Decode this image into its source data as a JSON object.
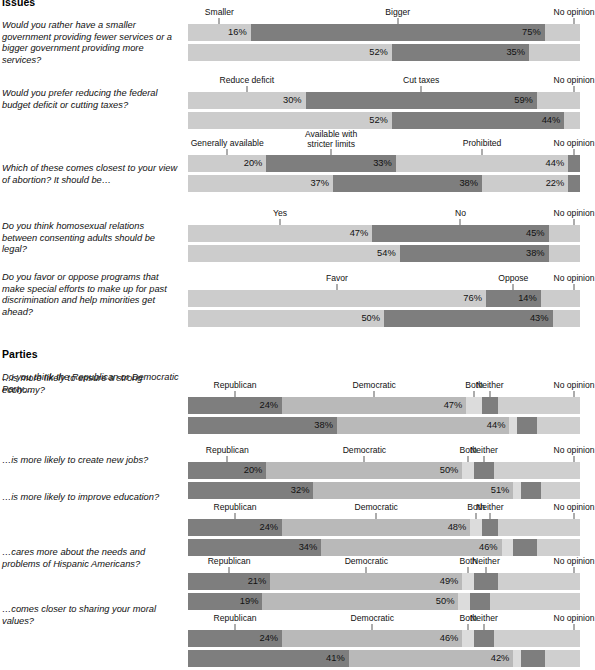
{
  "sections": [
    {
      "id": "issues",
      "title": "Issues"
    },
    {
      "id": "parties",
      "title": "Parties"
    }
  ],
  "row_labels": {
    "hispanics": "Hispanics",
    "non_hispanics": "Non-Hispanics"
  },
  "chart_data": [
    {
      "type": "bar",
      "section": "Issues",
      "title": "Would you rather have a smaller government providing fewer services or a bigger government providing more services?",
      "categories": [
        "Smaller",
        "Bigger",
        "No opinion"
      ],
      "series": [
        {
          "name": "Hispanics",
          "values": [
            16,
            75,
            9
          ],
          "labels": [
            "16%",
            "75%",
            ""
          ]
        },
        {
          "name": "Non-Hispanics",
          "values": [
            52,
            35,
            13
          ],
          "labels": [
            "52%",
            "35%",
            ""
          ]
        }
      ],
      "xlabel": "",
      "ylabel": "",
      "xlim": [
        0,
        100
      ],
      "grid": false,
      "legend": "none"
    },
    {
      "type": "bar",
      "section": "Issues",
      "title": "Would you prefer reducing the federal budget deficit or cutting taxes?",
      "categories": [
        "Reduce deficit",
        "Cut taxes",
        "No opinion"
      ],
      "series": [
        {
          "name": "Hispanics",
          "values": [
            30,
            59,
            11
          ],
          "labels": [
            "30%",
            "59%",
            ""
          ]
        },
        {
          "name": "Non-Hispanics",
          "values": [
            52,
            44,
            4
          ],
          "labels": [
            "52%",
            "44%",
            ""
          ]
        }
      ],
      "xlabel": "",
      "ylabel": "",
      "xlim": [
        0,
        100
      ],
      "grid": false,
      "legend": "none"
    },
    {
      "type": "bar",
      "section": "Issues",
      "title": "Which of these comes closest to your view of abortion? It should be…",
      "categories": [
        "Generally available",
        "Available with stricter limits",
        "Prohibited",
        "No opinion"
      ],
      "series": [
        {
          "name": "Hispanics",
          "values": [
            20,
            33,
            44,
            3
          ],
          "labels": [
            "20%",
            "33%",
            "44%",
            ""
          ]
        },
        {
          "name": "Non-Hispanics",
          "values": [
            37,
            38,
            22,
            3
          ],
          "labels": [
            "37%",
            "38%",
            "22%",
            ""
          ]
        }
      ],
      "xlabel": "",
      "ylabel": "",
      "xlim": [
        0,
        100
      ],
      "grid": false,
      "legend": "none"
    },
    {
      "type": "bar",
      "section": "Issues",
      "title": "Do you think homosexual relations between consenting adults should be legal?",
      "categories": [
        "Yes",
        "No",
        "No opinion"
      ],
      "series": [
        {
          "name": "Hispanics",
          "values": [
            47,
            45,
            8
          ],
          "labels": [
            "47%",
            "45%",
            ""
          ]
        },
        {
          "name": "Non-Hispanics",
          "values": [
            54,
            38,
            8
          ],
          "labels": [
            "54%",
            "38%",
            ""
          ]
        }
      ],
      "xlabel": "",
      "ylabel": "",
      "xlim": [
        0,
        100
      ],
      "grid": false,
      "legend": "none"
    },
    {
      "type": "bar",
      "section": "Issues",
      "title": "Do you favor or oppose programs that make special efforts to make up for past discrimination and help minorities get ahead?",
      "categories": [
        "Favor",
        "Oppose",
        "No opinion"
      ],
      "series": [
        {
          "name": "Hispanics",
          "values": [
            76,
            14,
            10
          ],
          "labels": [
            "76%",
            "14%",
            ""
          ]
        },
        {
          "name": "Non-Hispanics",
          "values": [
            50,
            43,
            7
          ],
          "labels": [
            "50%",
            "43%",
            ""
          ]
        }
      ],
      "xlabel": "",
      "ylabel": "",
      "xlim": [
        0,
        100
      ],
      "grid": false,
      "legend": "none"
    },
    {
      "type": "bar",
      "section": "Parties",
      "lead": "Do you think the Republican or Democratic Party…",
      "title": "…is more likely to ensure a strong economy?",
      "categories": [
        "Republican",
        "Democratic",
        "Both",
        "Neither",
        "No opinion"
      ],
      "series": [
        {
          "name": "Hispanics",
          "values": [
            24,
            47,
            4,
            4,
            21
          ],
          "labels": [
            "24%",
            "47%",
            "",
            "",
            ""
          ]
        },
        {
          "name": "Non-Hispanics",
          "values": [
            38,
            44,
            2,
            5,
            11
          ],
          "labels": [
            "38%",
            "44%",
            "",
            "",
            ""
          ]
        }
      ],
      "xlabel": "",
      "ylabel": "",
      "xlim": [
        0,
        100
      ],
      "grid": false,
      "legend": "none"
    },
    {
      "type": "bar",
      "section": "Parties",
      "title": "…is more likely to create new jobs?",
      "categories": [
        "Republican",
        "Democratic",
        "Both",
        "Neither",
        "No opinion"
      ],
      "series": [
        {
          "name": "Hispanics",
          "values": [
            20,
            50,
            3,
            5,
            22
          ],
          "labels": [
            "20%",
            "50%",
            "",
            "",
            ""
          ]
        },
        {
          "name": "Non-Hispanics",
          "values": [
            32,
            51,
            2,
            5,
            10
          ],
          "labels": [
            "32%",
            "51%",
            "",
            "",
            ""
          ]
        }
      ],
      "xlabel": "",
      "ylabel": "",
      "xlim": [
        0,
        100
      ],
      "grid": false,
      "legend": "none"
    },
    {
      "type": "bar",
      "section": "Parties",
      "title": "…is more likely to improve education?",
      "categories": [
        "Republican",
        "Democratic",
        "Both",
        "Neither",
        "No opinion"
      ],
      "series": [
        {
          "name": "Hispanics",
          "values": [
            24,
            48,
            3,
            4,
            21
          ],
          "labels": [
            "24%",
            "48%",
            "",
            "",
            ""
          ]
        },
        {
          "name": "Non-Hispanics",
          "values": [
            34,
            46,
            3,
            6,
            11
          ],
          "labels": [
            "34%",
            "46%",
            "",
            "",
            ""
          ]
        }
      ],
      "xlabel": "",
      "ylabel": "",
      "xlim": [
        0,
        100
      ],
      "grid": false,
      "legend": "none"
    },
    {
      "type": "bar",
      "section": "Parties",
      "title": "…cares more about the needs and problems of Hispanic Americans?",
      "categories": [
        "Republican",
        "Democratic",
        "Both",
        "Neither",
        "No opinion"
      ],
      "series": [
        {
          "name": "Hispanics",
          "values": [
            21,
            49,
            3,
            6,
            21
          ],
          "labels": [
            "21%",
            "49%",
            "",
            "",
            ""
          ]
        },
        {
          "name": "Non-Hispanics",
          "values": [
            19,
            50,
            3,
            5,
            23
          ],
          "labels": [
            "19%",
            "50%",
            "",
            "",
            ""
          ]
        }
      ],
      "xlabel": "",
      "ylabel": "",
      "xlim": [
        0,
        100
      ],
      "grid": false,
      "legend": "none"
    },
    {
      "type": "bar",
      "section": "Parties",
      "title": "…comes closer to sharing your moral values?",
      "categories": [
        "Republican",
        "Democratic",
        "Both",
        "Neither",
        "No opinion"
      ],
      "series": [
        {
          "name": "Hispanics",
          "values": [
            24,
            46,
            3,
            5,
            22
          ],
          "labels": [
            "24%",
            "46%",
            "",
            "",
            ""
          ]
        },
        {
          "name": "Non-Hispanics",
          "values": [
            41,
            42,
            2,
            6,
            9
          ],
          "labels": [
            "41%",
            "42%",
            "",
            "",
            ""
          ]
        }
      ],
      "xlabel": "",
      "ylabel": "",
      "xlim": [
        0,
        100
      ],
      "grid": false,
      "legend": "none"
    }
  ],
  "layout": {
    "bar_left": 188,
    "bar_width": 392,
    "groups": [
      {
        "chart": 0,
        "top": 2,
        "qtop": 20,
        "labeltop": 0
      },
      {
        "chart": 1,
        "top": 70,
        "qtop": 88,
        "labeltop": 0
      },
      {
        "chart": 2,
        "top": 133,
        "qtop": 163,
        "labeltop": 0
      },
      {
        "chart": 3,
        "top": 203,
        "qtop": 221,
        "labeltop": 0
      },
      {
        "chart": 4,
        "top": 268,
        "qtop": 272,
        "labeltop": 0
      },
      {
        "chart": 5,
        "top": 375,
        "qtop": 373,
        "labeltop": 0
      },
      {
        "chart": 6,
        "top": 440,
        "qtop": 455,
        "labeltop": 0
      },
      {
        "chart": 7,
        "top": 497,
        "qtop": 492,
        "labeltop": 0
      },
      {
        "chart": 8,
        "top": 551,
        "qtop": 547,
        "labeltop": 0
      },
      {
        "chart": 9,
        "top": 608,
        "qtop": 604,
        "labeltop": 0
      }
    ],
    "section_heads": [
      {
        "section": 0,
        "top": -4
      },
      {
        "section": 1,
        "top": 348
      }
    ],
    "lead_top": 372
  },
  "colors": {
    "light": "#cccccc",
    "dark": "#7e7e7e",
    "mid": "#b9b9b9",
    "track": "#e9e9e9",
    "text": "#111111"
  }
}
